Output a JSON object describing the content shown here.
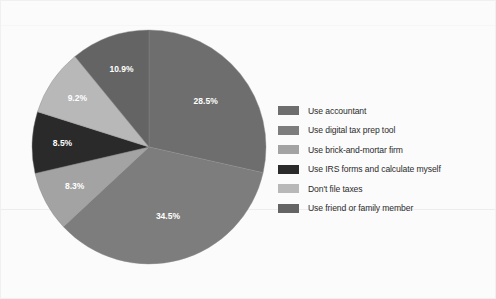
{
  "chart_data": {
    "type": "pie",
    "title": "",
    "subtitle": "",
    "xlabel": "",
    "ylabel": "",
    "legend_position": "right",
    "grid": false,
    "total": 99.9,
    "unit": "%",
    "start_angle_deg": 0,
    "direction": "clockwise",
    "categories": [
      "Use accountant",
      "Use digital tax prep tool",
      "Use brick-and-mortar firm",
      "Use IRS forms and calculate myself",
      "Don't file taxes",
      "Use friend or family member"
    ],
    "values": [
      28.5,
      34.5,
      8.3,
      8.5,
      9.2,
      10.9
    ],
    "value_labels": [
      "28.5%",
      "34.5%",
      "8.3%",
      "8.5%",
      "9.2%",
      "10.9%"
    ],
    "colors": [
      "#6e6e6e",
      "#7d7d7d",
      "#a3a3a3",
      "#2a2a2a",
      "#b8b8b8",
      "#646464"
    ],
    "slices": [
      {
        "label": "Use accountant",
        "value": 28.5,
        "value_label": "28.5%",
        "color": "#6e6e6e"
      },
      {
        "label": "Use digital tax prep tool",
        "value": 34.5,
        "value_label": "34.5%",
        "color": "#7d7d7d"
      },
      {
        "label": "Use brick-and-mortar firm",
        "value": 8.3,
        "value_label": "8.3%",
        "color": "#a3a3a3"
      },
      {
        "label": "Use IRS forms and calculate myself",
        "value": 8.5,
        "value_label": "8.5%",
        "color": "#2a2a2a"
      },
      {
        "label": "Don't file taxes",
        "value": 9.2,
        "value_label": "9.2%",
        "color": "#b8b8b8"
      },
      {
        "label": "Use friend or family member",
        "value": 10.9,
        "value_label": "10.9%",
        "color": "#646464"
      }
    ]
  },
  "legend": {
    "items": [
      {
        "label": "Use accountant",
        "color": "#6e6e6e"
      },
      {
        "label": "Use digital tax prep tool",
        "color": "#7d7d7d"
      },
      {
        "label": "Use brick-and-mortar firm",
        "color": "#a3a3a3"
      },
      {
        "label": "Use IRS forms and calculate myself",
        "color": "#2a2a2a"
      },
      {
        "label": "Don't file taxes",
        "color": "#b8b8b8"
      },
      {
        "label": "Use friend or family member",
        "color": "#646464"
      }
    ]
  },
  "style": {
    "background": "#fbfbfb",
    "label_text_color": "#ffffff",
    "legend_text_color": "#2b2b2b"
  }
}
